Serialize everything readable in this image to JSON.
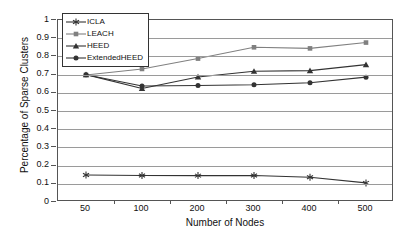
{
  "chart_data": {
    "type": "line",
    "title": "",
    "xlabel": "Number of Nodes",
    "ylabel": "Percentage of Sparse Clusters",
    "categories": [
      "50",
      "100",
      "200",
      "300",
      "400",
      "500"
    ],
    "x": [
      50,
      100,
      200,
      300,
      400,
      500
    ],
    "ylim": [
      0,
      1
    ],
    "ytick_labels": [
      "0",
      "0.1",
      "0.2",
      "0.3",
      "0.4",
      "0.5",
      "0.6",
      "0.7",
      "0.8",
      "0.9",
      "1"
    ],
    "ytick_values": [
      0,
      0.1,
      0.2,
      0.3,
      0.4,
      0.5,
      0.6,
      0.7,
      0.8,
      0.9,
      1
    ],
    "grid": "horizontal",
    "legend_position": "top-left",
    "series": [
      {
        "name": "ICLA",
        "marker": "asterisk",
        "color": "#333333",
        "values": [
          0.148,
          0.146,
          0.145,
          0.146,
          0.136,
          0.105
        ]
      },
      {
        "name": "LEACH",
        "marker": "square",
        "color": "#808080",
        "values": [
          0.698,
          0.731,
          0.788,
          0.85,
          0.844,
          0.876
        ]
      },
      {
        "name": "HEED",
        "marker": "triangle",
        "color": "#333333",
        "values": [
          0.7,
          0.624,
          0.687,
          0.718,
          0.722,
          0.755
        ]
      },
      {
        "name": "ExtendedHEED",
        "marker": "circle",
        "color": "#333333",
        "values": [
          0.699,
          0.637,
          0.64,
          0.644,
          0.655,
          0.686
        ]
      }
    ]
  }
}
